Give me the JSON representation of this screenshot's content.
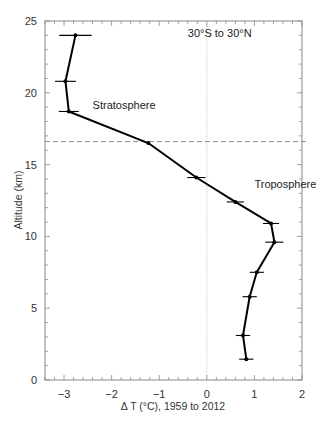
{
  "chart_data": {
    "type": "line",
    "title": "",
    "xlabel": "Δ T (°C), 1959 to 2012",
    "ylabel": "Altitude (km)",
    "xlim": [
      -3.4,
      2
    ],
    "ylim": [
      0,
      25
    ],
    "x_ticks": [
      -3,
      -2,
      -1,
      0,
      1,
      2
    ],
    "x_tick_labels": [
      "−3",
      "−2",
      "−1",
      "0",
      "1",
      "2"
    ],
    "y_ticks": [
      0,
      5,
      10,
      15,
      20,
      25
    ],
    "y_tick_labels": [
      "0",
      "5",
      "10",
      "15",
      "20",
      "25"
    ],
    "x_minor_step": 0.2,
    "y_minor_step": 1,
    "grid": false,
    "legend": null,
    "series": [
      {
        "name": "Temperature change profile",
        "color": "#000000",
        "points": [
          {
            "dT": -2.76,
            "alt": 24.0,
            "err": 0.34
          },
          {
            "dT": -2.97,
            "alt": 20.8,
            "err": 0.22
          },
          {
            "dT": -2.9,
            "alt": 18.7,
            "err": 0.21
          },
          {
            "dT": -1.23,
            "alt": 16.5,
            "err": 0.0
          },
          {
            "dT": -0.22,
            "alt": 14.1,
            "err": 0.19
          },
          {
            "dT": 0.6,
            "alt": 12.4,
            "err": 0.18
          },
          {
            "dT": 1.35,
            "alt": 10.9,
            "err": 0.17
          },
          {
            "dT": 1.42,
            "alt": 9.6,
            "err": 0.19
          },
          {
            "dT": 1.05,
            "alt": 7.5,
            "err": 0.15
          },
          {
            "dT": 0.9,
            "alt": 5.8,
            "err": 0.15
          },
          {
            "dT": 0.76,
            "alt": 3.1,
            "err": 0.15
          },
          {
            "dT": 0.83,
            "alt": 1.45,
            "err": 0.15
          }
        ]
      }
    ],
    "reference_lines": [
      {
        "type": "vertical",
        "x": 0,
        "style": "dotted",
        "color": "#999999"
      },
      {
        "type": "horizontal",
        "y": 16.6,
        "style": "dashed",
        "color": "#888888",
        "label": "Tropopause"
      }
    ],
    "annotations": [
      {
        "text": "30°S to 30°N",
        "x": -0.4,
        "y": 23.9
      },
      {
        "text": "Stratosphere",
        "x": -2.4,
        "y": 18.9
      },
      {
        "text": "Troposphere",
        "x": 1.0,
        "y": 13.4
      }
    ]
  }
}
